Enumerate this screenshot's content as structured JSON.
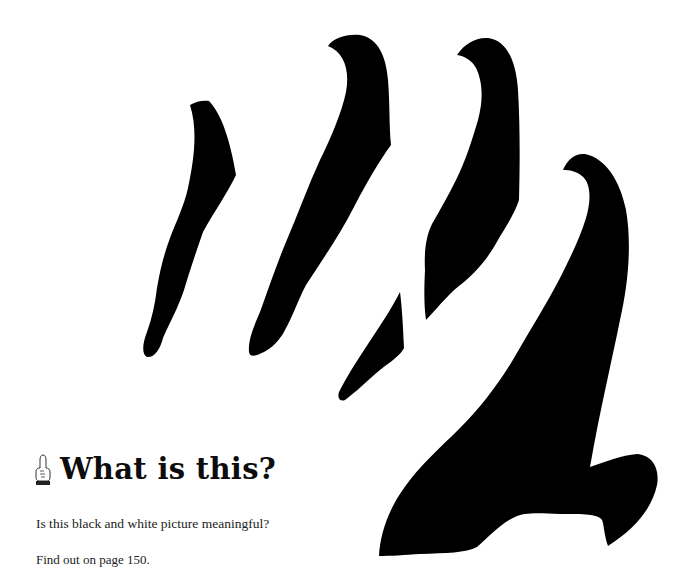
{
  "figure": {
    "fill_color": "#000000",
    "background_color": "#ffffff"
  },
  "heading": {
    "icon": "pointing-hand-icon",
    "title": "What is this?"
  },
  "body": {
    "question": "Is this black and white picture meaningful?",
    "page_reference": "Find out on page 150."
  }
}
